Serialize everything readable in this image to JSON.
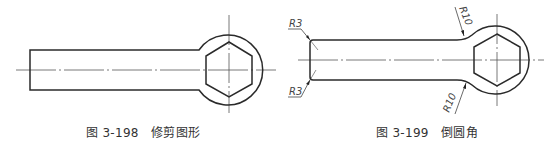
{
  "figures": [
    {
      "id": "fig-3-198",
      "caption_number": "图 3-198",
      "caption_title": "修剪图形",
      "caption": "图 3-198   修剪图形",
      "description": "Wrench outline after trimming: rectangular handle with circular head containing a hexagon, with center lines"
    },
    {
      "id": "fig-3-199",
      "caption_number": "图 3-199",
      "caption_title": "倒圆角",
      "caption": "图 3-199   倒圆角",
      "description": "Wrench outline after filleting: handle corners rounded R3, handle-to-head transitions rounded R10",
      "dimensions": {
        "r3_top": "R3",
        "r3_bottom": "R3",
        "r10_top": "R10",
        "r10_bottom": "R10"
      }
    }
  ],
  "colors": {
    "outline": "#2a2a2a",
    "centerline": "#555555",
    "dimension": "#444444",
    "caption": "#333333"
  }
}
